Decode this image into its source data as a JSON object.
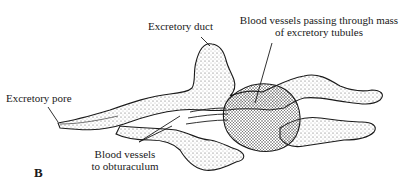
{
  "figure": {
    "panel_letter": "B",
    "labels": {
      "excretory_pore": "Excretory pore",
      "excretory_duct": "Excretory duct",
      "blood_vessels_mass_line1": "Blood vessels passing through mass",
      "blood_vessels_mass_line2": "of excretory tubules",
      "blood_vessels_obturaculum_line1": "Blood vessels",
      "blood_vessels_obturaculum_line2": "to obturaculum"
    },
    "colors": {
      "ink": "#1a1a1a",
      "stipple": "#555555",
      "background": "#ffffff"
    }
  }
}
